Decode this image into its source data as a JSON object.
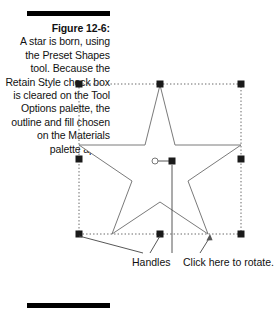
{
  "figure": {
    "number_label": "Figure 12-6:",
    "caption_text": "A star is born, using the Preset Shapes tool. Because the Retain Style check box is cleared on the Tool Options palette, the outline and fill chosen on the Materials palette apply.",
    "rule_color": "#000000"
  },
  "annotations": {
    "handles_label": "Handles",
    "rotate_label": "Click here to rotate."
  },
  "artwork": {
    "shape_name": "star",
    "shape_outline_color": "#6e6e6e",
    "shape_fill_color": "#ffffff",
    "selection_box_color": "#555555",
    "handle_color": "#1a1a1a",
    "leader_line_color": "#444444",
    "handle_count": 8,
    "bounding_box": {
      "left": 79,
      "top": 84,
      "right": 241,
      "bottom": 234
    },
    "rotation_pivot": {
      "x": 155,
      "y": 161
    },
    "center_handle": {
      "x": 172,
      "y": 161
    }
  }
}
